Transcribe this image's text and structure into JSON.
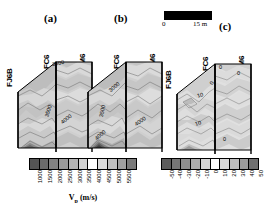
{
  "figure": {
    "type": "seismic-tomography-fence-diagram",
    "background": "#ffffff",
    "panel_letters": [
      "(a)",
      "(b)",
      "(c)"
    ]
  },
  "scalebar": {
    "name": "distance-scale-bar",
    "min_label": "0",
    "max_label": "15 m",
    "length_m": 15,
    "bar_color": "#000000"
  },
  "wells": {
    "left": "FJ6B",
    "middle": "FC6",
    "right": "FM6"
  },
  "panels": [
    {
      "id": "a",
      "letter": "(a)",
      "wells": [
        "FJ6B",
        "FC6",
        "FM6"
      ],
      "contour_labels": [
        "3500",
        "3500",
        "4000"
      ],
      "quantity": "Vp"
    },
    {
      "id": "b",
      "letter": "(b)",
      "wells": [
        "FJ6B",
        "FC6",
        "FM6"
      ],
      "contour_labels": [
        "3000",
        "3500",
        "4000",
        "4000"
      ],
      "quantity": "Vp"
    },
    {
      "id": "c",
      "letter": "(c)",
      "wells": [
        "FJ6B",
        "FC6",
        "FM6"
      ],
      "contour_labels": [
        "0",
        "10",
        "10",
        "0",
        "0",
        "0"
      ],
      "quantity": "Vp-difference"
    }
  ],
  "colorbars": [
    {
      "name": "vp-colorbar",
      "title_main": "V",
      "title_sub": "p",
      "title_units": " (m/s)",
      "ticks": [
        "1000",
        "1500",
        "2000",
        "2500",
        "3000",
        "3500",
        "4000",
        "4500",
        "5000",
        "5500"
      ],
      "n_cells": 11,
      "cell_colors": [
        "#555555",
        "#6b6b6b",
        "#828282",
        "#9a9a9a",
        "#b4b4b4",
        "#d2d2d2",
        "#ffffff",
        "#dcdcdc",
        "#c0c0c0",
        "#a0a0a0",
        "#7a7a7a"
      ]
    },
    {
      "name": "difference-colorbar",
      "title_main": "",
      "title_sub": "",
      "title_units": "",
      "ticks": [
        "-50",
        "-40",
        "-30",
        "-20",
        "-10",
        "0",
        "10",
        "20",
        "30",
        "40",
        "50"
      ],
      "n_cells": 10,
      "cell_colors": [
        "#5c5c5c",
        "#767676",
        "#8e8e8e",
        "#ababab",
        "#d6d6d6",
        "#ffffff",
        "#dadada",
        "#bcbcbc",
        "#9c9c9c",
        "#707070"
      ]
    }
  ],
  "chart_data": {
    "type": "heatmap",
    "title": "",
    "xlabel": "",
    "ylabel": "",
    "subplots": [
      {
        "panel": "(a)",
        "quantity": "Vp",
        "units": "m/s",
        "contour_levels": [
          3000,
          3500,
          4000,
          4500
        ],
        "labeled_contours": [
          "3500",
          "3500",
          "4000"
        ],
        "axis_wells": [
          "FJ6B",
          "FC6",
          "FM6"
        ],
        "value_range": [
          1000,
          5500
        ]
      },
      {
        "panel": "(b)",
        "quantity": "Vp",
        "units": "m/s",
        "contour_levels": [
          3000,
          3500,
          4000,
          4500
        ],
        "labeled_contours": [
          "3000",
          "3500",
          "4000",
          "4000"
        ],
        "axis_wells": [
          "FJ6B",
          "FC6",
          "FM6"
        ],
        "value_range": [
          1000,
          5500
        ]
      },
      {
        "panel": "(c)",
        "quantity": "Vp difference",
        "units": "%",
        "contour_levels": [
          -10,
          0,
          10
        ],
        "labeled_contours": [
          "0",
          "10",
          "10",
          "0"
        ],
        "axis_wells": [
          "FJ6B",
          "FC6",
          "FM6"
        ],
        "value_range": [
          -50,
          50
        ]
      }
    ],
    "legend_position": "bottom",
    "grid": false
  }
}
